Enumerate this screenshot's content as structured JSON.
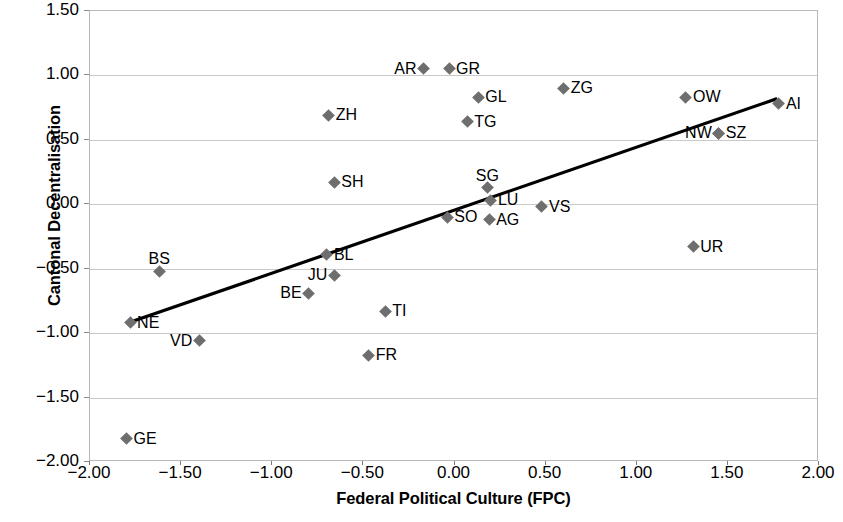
{
  "chart_data": {
    "type": "scatter",
    "title": "",
    "xlabel": "Federal Political Culture (FPC)",
    "ylabel": "Cantonal Decentralisation",
    "xlim": [
      -2.0,
      2.0
    ],
    "ylim": [
      -2.0,
      1.5
    ],
    "xticks": [
      "-2.00",
      "-1.50",
      "-1.00",
      "-0.50",
      "0.00",
      "0.50",
      "1.00",
      "1.50",
      "2.00"
    ],
    "yticks": [
      "1.50",
      "1.00",
      "0.50",
      "0.00",
      "-0.50",
      "-1.00",
      "-1.50",
      "-2.00"
    ],
    "xtick_values": [
      -2.0,
      -1.5,
      -1.0,
      -0.5,
      0.0,
      0.5,
      1.0,
      1.5,
      2.0
    ],
    "ytick_values": [
      1.5,
      1.0,
      0.5,
      0.0,
      -0.5,
      -1.0,
      -1.5,
      -2.0
    ],
    "grid": "horizontal",
    "legend": "none",
    "marker": "diamond",
    "marker_color": "#6e6e6e",
    "trendline": {
      "type": "linear",
      "color": "#000000",
      "x_start": -1.79,
      "y_start": -0.92,
      "x_end": 1.77,
      "y_end": 0.82
    },
    "points": [
      {
        "label": "AR",
        "x": -0.17,
        "y": 1.05,
        "pos": "left"
      },
      {
        "label": "GR",
        "x": -0.03,
        "y": 1.05,
        "pos": "right"
      },
      {
        "label": "ZG",
        "x": 0.6,
        "y": 0.9,
        "pos": "right"
      },
      {
        "label": "GL",
        "x": 0.13,
        "y": 0.83,
        "pos": "right"
      },
      {
        "label": "OW",
        "x": 1.27,
        "y": 0.83,
        "pos": "right"
      },
      {
        "label": "AI",
        "x": 1.78,
        "y": 0.78,
        "pos": "right"
      },
      {
        "label": "ZH",
        "x": -0.69,
        "y": 0.69,
        "pos": "right"
      },
      {
        "label": "TG",
        "x": 0.07,
        "y": 0.64,
        "pos": "right"
      },
      {
        "label": "SZ",
        "x": 1.45,
        "y": 0.55,
        "pos": "right"
      },
      {
        "label": "NW",
        "x": 1.45,
        "y": 0.55,
        "pos": "left"
      },
      {
        "label": "SH",
        "x": -0.66,
        "y": 0.17,
        "pos": "right"
      },
      {
        "label": "SG",
        "x": 0.18,
        "y": 0.13,
        "pos": "above"
      },
      {
        "label": "LU",
        "x": 0.2,
        "y": 0.03,
        "pos": "right"
      },
      {
        "label": "VS",
        "x": 0.48,
        "y": -0.02,
        "pos": "right"
      },
      {
        "label": "SO",
        "x": -0.04,
        "y": -0.1,
        "pos": "right"
      },
      {
        "label": "AG",
        "x": 0.19,
        "y": -0.12,
        "pos": "right"
      },
      {
        "label": "UR",
        "x": 1.31,
        "y": -0.33,
        "pos": "right"
      },
      {
        "label": "BL",
        "x": -0.7,
        "y": -0.39,
        "pos": "right"
      },
      {
        "label": "BS",
        "x": -1.62,
        "y": -0.52,
        "pos": "above"
      },
      {
        "label": "JU",
        "x": -0.66,
        "y": -0.55,
        "pos": "left"
      },
      {
        "label": "BE",
        "x": -0.8,
        "y": -0.69,
        "pos": "left"
      },
      {
        "label": "TI",
        "x": -0.38,
        "y": -0.83,
        "pos": "right"
      },
      {
        "label": "NE",
        "x": -1.78,
        "y": -0.92,
        "pos": "right"
      },
      {
        "label": "VD",
        "x": -1.4,
        "y": -1.06,
        "pos": "left"
      },
      {
        "label": "FR",
        "x": -0.47,
        "y": -1.17,
        "pos": "right"
      },
      {
        "label": "GE",
        "x": -1.8,
        "y": -1.82,
        "pos": "right"
      }
    ]
  }
}
